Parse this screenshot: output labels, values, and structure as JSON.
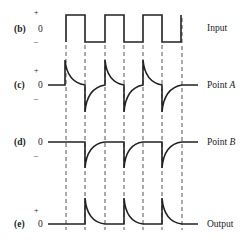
{
  "panels": [
    {
      "id": "b",
      "tag": "(b)",
      "plus": "+",
      "zero": "0",
      "minus": "–",
      "name": "Input",
      "name_italic": ""
    },
    {
      "id": "c",
      "tag": "(c)",
      "plus": "+",
      "zero": "0",
      "minus": "–",
      "name": "Point ",
      "name_italic": "A"
    },
    {
      "id": "d",
      "tag": "(d)",
      "plus": "",
      "zero": "0",
      "minus": "–",
      "name": "Point ",
      "name_italic": "B"
    },
    {
      "id": "e",
      "tag": "(e)",
      "plus": "+",
      "zero": "0",
      "minus": "",
      "name": "Output",
      "name_italic": ""
    }
  ],
  "colors": {
    "trace": "#222222",
    "dash": "#555555"
  }
}
